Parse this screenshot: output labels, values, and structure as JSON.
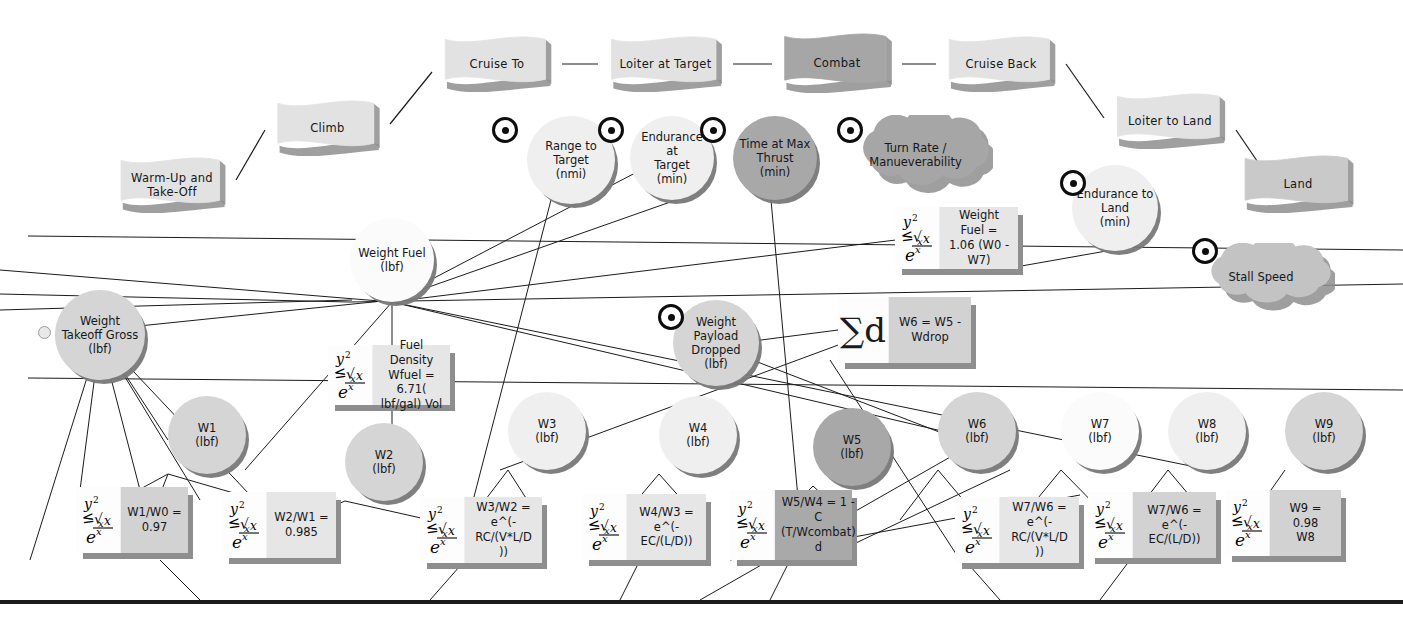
{
  "diagram": {
    "colors": {
      "flag_light": "#e2e2e2",
      "flag_dark": "#a6a6a6",
      "circle_light": "#efefef",
      "circle_mid": "#d5d5d5",
      "circle_dark": "#a8a8a8",
      "circle_white": "#fbfbfb",
      "box_light": "#e6e6e6",
      "box_mid": "#d2d2d2",
      "box_dark": "#a9a9a9",
      "shadow": "#8e8e8e",
      "line": "#1b1b1b"
    }
  },
  "mission_phases": [
    {
      "id": "warm-up-and-take-off",
      "label": "Warm-Up and\nTake-Off",
      "x": 108,
      "y": 157,
      "w": 128,
      "h": 56,
      "tone": "light"
    },
    {
      "id": "climb",
      "label": "Climb",
      "x": 265,
      "y": 100,
      "w": 125,
      "h": 56,
      "tone": "light"
    },
    {
      "id": "cruise-to",
      "label": "Cruise To",
      "x": 432,
      "y": 36,
      "w": 130,
      "h": 56,
      "tone": "light"
    },
    {
      "id": "loiter-at-target",
      "label": "Loiter at Target",
      "x": 598,
      "y": 36,
      "w": 135,
      "h": 56,
      "tone": "light"
    },
    {
      "id": "combat",
      "label": "Combat",
      "x": 772,
      "y": 33,
      "w": 130,
      "h": 60,
      "tone": "dark"
    },
    {
      "id": "cruise-back",
      "label": "Cruise Back",
      "x": 936,
      "y": 36,
      "w": 130,
      "h": 56,
      "tone": "light"
    },
    {
      "id": "loiter-to-land",
      "label": "Loiter to Land",
      "x": 1104,
      "y": 93,
      "w": 132,
      "h": 56,
      "tone": "light"
    },
    {
      "id": "land",
      "label": "Land",
      "x": 1232,
      "y": 155,
      "w": 132,
      "h": 58,
      "tone": "mid"
    }
  ],
  "requirements": [
    {
      "id": "range-to-target",
      "label": "Range to\nTarget\n(nmi)",
      "shape": "circle",
      "x": 527,
      "y": 116,
      "d": 88,
      "tone": "light",
      "target": {
        "x": 492,
        "y": 117
      }
    },
    {
      "id": "endurance-at-target",
      "label": "Endurance at\nTarget\n(min)",
      "shape": "circle",
      "x": 630,
      "y": 116,
      "d": 84,
      "tone": "light",
      "target": {
        "x": 598,
        "y": 117
      }
    },
    {
      "id": "time-at-max-thrust",
      "label": "Time at Max\nThrust\n(min)",
      "shape": "circle",
      "x": 733,
      "y": 116,
      "d": 84,
      "tone": "dark",
      "target": {
        "x": 700,
        "y": 117
      }
    },
    {
      "id": "turn-rate-manueverability",
      "label": "Turn Rate /\nManueverability",
      "shape": "cloud",
      "x": 848,
      "y": 115,
      "w": 135,
      "h": 80,
      "tone": "dark",
      "target": {
        "x": 837,
        "y": 117
      }
    },
    {
      "id": "endurance-to-land",
      "label": "Endurance to\nLand\n(min)",
      "shape": "circle",
      "x": 1072,
      "y": 165,
      "d": 86,
      "tone": "light",
      "target": {
        "x": 1060,
        "y": 170
      }
    },
    {
      "id": "stall-speed",
      "label": "Stall Speed",
      "shape": "cloud",
      "x": 1197,
      "y": 243,
      "w": 128,
      "h": 68,
      "tone": "mid",
      "target": {
        "x": 1192,
        "y": 238
      }
    },
    {
      "id": "weight-payload-dropped",
      "label": "Weight\nPayload\nDropped\n(lbf)",
      "shape": "circle",
      "x": 673,
      "y": 300,
      "d": 86,
      "tone": "mid",
      "target": {
        "x": 658,
        "y": 304
      }
    }
  ],
  "weight_nodes": [
    {
      "id": "weight-fuel",
      "label": "Weight  Fuel\n(lbf)",
      "x": 350,
      "y": 218,
      "d": 84,
      "tone": "white"
    },
    {
      "id": "weight-takeoff-gross",
      "label": "Weight\nTakeoff  Gross\n(lbf)",
      "x": 55,
      "y": 290,
      "d": 90,
      "tone": "mid",
      "knob": {
        "x": 38,
        "y": 326
      }
    },
    {
      "id": "w1",
      "label": "W1\n(lbf)",
      "x": 168,
      "y": 396,
      "d": 78,
      "tone": "mid"
    },
    {
      "id": "w2",
      "label": "W2\n(lbf)",
      "x": 345,
      "y": 423,
      "d": 78,
      "tone": "mid"
    },
    {
      "id": "w3",
      "label": "W3\n(lbf)",
      "x": 508,
      "y": 392,
      "d": 78,
      "tone": "light"
    },
    {
      "id": "w4",
      "label": "W4\n(lbf)",
      "x": 659,
      "y": 396,
      "d": 78,
      "tone": "light"
    },
    {
      "id": "w5",
      "label": "W5\n(lbf)",
      "x": 813,
      "y": 408,
      "d": 78,
      "tone": "dark"
    },
    {
      "id": "w6",
      "label": "W6\n(lbf)",
      "x": 938,
      "y": 392,
      "d": 78,
      "tone": "mid"
    },
    {
      "id": "w7",
      "label": "W7\n(lbf)",
      "x": 1061,
      "y": 392,
      "d": 78,
      "tone": "white"
    },
    {
      "id": "w8",
      "label": "W8\n(lbf)",
      "x": 1168,
      "y": 392,
      "d": 78,
      "tone": "light"
    },
    {
      "id": "w9",
      "label": "W9\n(lbf)",
      "x": 1285,
      "y": 392,
      "d": 78,
      "tone": "mid"
    }
  ],
  "equations": [
    {
      "id": "eq-weight-fuel",
      "icon": "formula-icon",
      "text": "Weight  Fuel =\n1.06 (W0 -\nW7)",
      "x": 895,
      "y": 207,
      "w": 123,
      "h": 62,
      "tone": "light"
    },
    {
      "id": "eq-w6-sum",
      "icon": "sigma-icon",
      "text": "W6 = W5 -\nWdrop",
      "x": 838,
      "y": 297,
      "w": 133,
      "h": 66,
      "tone": "mid"
    },
    {
      "id": "eq-fuel-density",
      "icon": "formula-icon",
      "text": "Fuel Density\nWfuel  =  6.71(\nlbf/gal)  Vol",
      "x": 328,
      "y": 345,
      "w": 122,
      "h": 60,
      "tone": "light"
    },
    {
      "id": "eq-w1-w0",
      "icon": "formula-icon",
      "text": "W1/W0 =\n0.97",
      "x": 76,
      "y": 487,
      "w": 112,
      "h": 66,
      "tone": "mid"
    },
    {
      "id": "eq-w2-w1",
      "icon": "formula-icon",
      "text": "W2/W1 =\n0.985",
      "x": 222,
      "y": 492,
      "w": 114,
      "h": 66,
      "tone": "light"
    },
    {
      "id": "eq-w3-w2",
      "icon": "formula-icon",
      "text": "W3/W2 =\ne^(-RC/(V*L/D\n))",
      "x": 420,
      "y": 497,
      "w": 122,
      "h": 66,
      "tone": "light"
    },
    {
      "id": "eq-w4-w3",
      "icon": "formula-icon",
      "text": "W4/W3 =\ne^(-EC/(L/D))",
      "x": 582,
      "y": 494,
      "w": 124,
      "h": 66,
      "tone": "light"
    },
    {
      "id": "eq-w5-w4",
      "icon": "formula-icon",
      "text": "W5/W4 = 1 -\nC\n(T/Wcombat)\nd",
      "x": 730,
      "y": 490,
      "w": 122,
      "h": 70,
      "tone": "dark"
    },
    {
      "id": "eq-w7-w6-range",
      "icon": "formula-icon",
      "text": "W7/W6 =\ne^(-RC/(V*L/D\n))",
      "x": 955,
      "y": 497,
      "w": 124,
      "h": 66,
      "tone": "light"
    },
    {
      "id": "eq-w7-w6-endurance",
      "icon": "formula-icon",
      "text": "W7/W6 =\ne^(-EC/(L/D))",
      "x": 1088,
      "y": 492,
      "w": 128,
      "h": 66,
      "tone": "mid"
    },
    {
      "id": "eq-w9-w8",
      "icon": "formula-icon",
      "text": "W9 = 0.98\nW8",
      "x": 1225,
      "y": 490,
      "w": 116,
      "h": 66,
      "tone": "mid"
    }
  ],
  "connectors": {
    "phase_chain": [
      [
        236,
        180,
        265,
        130
      ],
      [
        390,
        124,
        432,
        72
      ],
      [
        562,
        64,
        598,
        64
      ],
      [
        733,
        64,
        772,
        64
      ],
      [
        902,
        64,
        936,
        64
      ],
      [
        1066,
        64,
        1104,
        118
      ],
      [
        1236,
        130,
        1270,
        180
      ]
    ],
    "long_lines": [
      [
        28,
        236,
        1403,
        250
      ],
      [
        0,
        294,
        350,
        302
      ],
      [
        0,
        310,
        352,
        300
      ],
      [
        28,
        378,
        1403,
        390
      ],
      [
        350,
        302,
        1403,
        284
      ],
      [
        390,
        302,
        1010,
        226
      ]
    ],
    "requirement_drops": [
      [
        551,
        200,
        468,
        520
      ],
      [
        676,
        200,
        392,
        300
      ],
      [
        660,
        160,
        392,
        300
      ],
      [
        771,
        200,
        800,
        520
      ],
      [
        1112,
        250,
        1010,
        268
      ],
      [
        715,
        346,
        838,
        330
      ],
      [
        716,
        346,
        960,
        440
      ]
    ],
    "node_links": [
      [
        392,
        300,
        392,
        430
      ],
      [
        392,
        300,
        100,
        330
      ],
      [
        392,
        300,
        392,
        262
      ],
      [
        100,
        336,
        30,
        560
      ],
      [
        100,
        336,
        80,
        490
      ],
      [
        100,
        336,
        140,
        490
      ],
      [
        100,
        336,
        168,
        440
      ],
      [
        100,
        336,
        250,
        495
      ],
      [
        100,
        336,
        200,
        500
      ],
      [
        168,
        474,
        120,
        500
      ],
      [
        168,
        474,
        150,
        520
      ],
      [
        168,
        474,
        275,
        505
      ],
      [
        345,
        501,
        300,
        520
      ],
      [
        345,
        501,
        430,
        520
      ],
      [
        508,
        470,
        470,
        520
      ],
      [
        508,
        470,
        540,
        520
      ],
      [
        659,
        474,
        620,
        520
      ],
      [
        659,
        474,
        700,
        520
      ],
      [
        813,
        486,
        780,
        520
      ],
      [
        813,
        486,
        850,
        520
      ],
      [
        938,
        470,
        900,
        520
      ],
      [
        938,
        470,
        980,
        520
      ],
      [
        1061,
        470,
        1020,
        520
      ],
      [
        1061,
        470,
        1110,
        520
      ],
      [
        1168,
        470,
        1130,
        520
      ],
      [
        1168,
        470,
        1210,
        520
      ],
      [
        1285,
        470,
        1250,
        520
      ],
      [
        160,
        560,
        200,
        600
      ],
      [
        460,
        566,
        430,
        600
      ],
      [
        640,
        560,
        620,
        600
      ],
      [
        790,
        560,
        770,
        600
      ],
      [
        970,
        566,
        1000,
        600
      ],
      [
        1130,
        560,
        1100,
        600
      ]
    ],
    "cross_lines": [
      [
        0,
        270,
        392,
        302
      ],
      [
        392,
        302,
        980,
        440
      ],
      [
        980,
        440,
        700,
        600
      ],
      [
        392,
        302,
        1210,
        470
      ],
      [
        500,
        470,
        960,
        300
      ],
      [
        820,
        560,
        1010,
        470
      ],
      [
        730,
        560,
        1080,
        495
      ],
      [
        960,
        560,
        830,
        360
      ],
      [
        245,
        470,
        392,
        302
      ]
    ]
  },
  "bottom_rule": {
    "y": 600
  }
}
